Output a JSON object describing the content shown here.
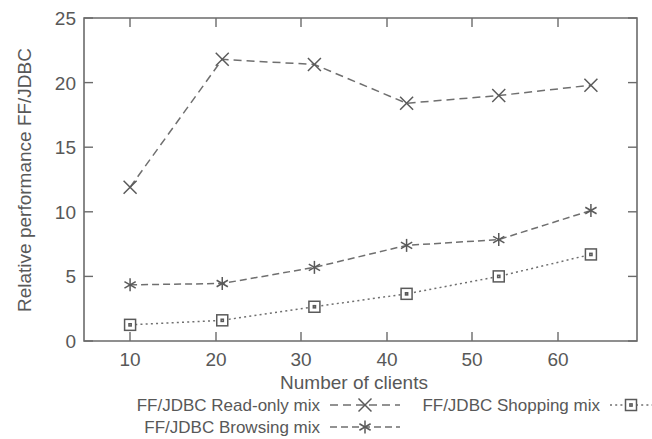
{
  "chart_data": {
    "type": "line",
    "title": "",
    "xlabel": "Number of clients",
    "ylabel": "Relative performance FF/JDBC",
    "x": [
      10,
      20,
      30,
      40,
      50,
      60
    ],
    "xlim": [
      5,
      65
    ],
    "ylim": [
      0,
      25
    ],
    "xticks": [
      "10",
      "20",
      "30",
      "40",
      "50",
      "60"
    ],
    "yticks": [
      "0",
      "5",
      "10",
      "15",
      "20",
      "25"
    ],
    "grid": false,
    "legend_position": "below-axes",
    "series": [
      {
        "name": "FF/JDBC Read-only mix",
        "marker": "x-cross",
        "dash": "dashed",
        "values": [
          11.9,
          21.8,
          21.4,
          18.4,
          19.0,
          19.8
        ]
      },
      {
        "name": "FF/JDBC Browsing mix",
        "marker": "asterisk",
        "dash": "dash-dot",
        "values": [
          4.35,
          4.45,
          5.7,
          7.4,
          7.85,
          10.1
        ]
      },
      {
        "name": "FF/JDBC Shopping mix",
        "marker": "open-square",
        "dash": "dotted",
        "values": [
          1.25,
          1.6,
          2.65,
          3.65,
          5.0,
          6.7
        ]
      }
    ],
    "colors": {
      "axis": "#6b6b6b",
      "text": "#585858",
      "series": "#6f6f6f",
      "background": "#ffffff"
    }
  },
  "legend": {
    "entries": [
      {
        "label": "FF/JDBC Read-only mix"
      },
      {
        "label": "FF/JDBC Browsing mix"
      },
      {
        "label": "FF/JDBC Shopping mix"
      }
    ]
  }
}
